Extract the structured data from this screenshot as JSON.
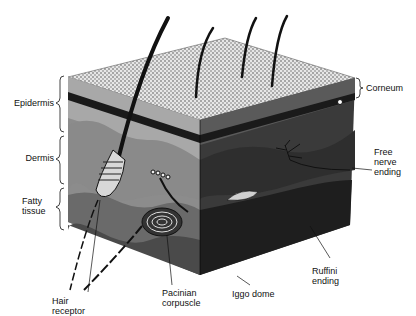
{
  "diagram": {
    "layer_labels": {
      "epidermis": "Epidermis",
      "dermis": "Dermis",
      "fatty_tissue": "Fatty\ntissue",
      "corneum": "Corneum"
    },
    "receptor_labels": {
      "free_nerve_ending": "Free\nnerve\nending",
      "ruffini_ending": "Ruffini\nending",
      "iggo_dome": "Iggo dome",
      "pacinian_corpuscle": "Pacinian\ncorpuscle",
      "hair_receptor": "Hair\nreceptor"
    },
    "colors": {
      "surface": "#cfcfcf",
      "epidermis_left": "#a8a8a8",
      "epidermis_right": "#5a5a5a",
      "dermis_left": "#8c8c8c",
      "dermis_right": "#3a3a3a",
      "fat_left": "#6a6a6a",
      "fat_right": "#1e1e1e",
      "band": "#1a1a1a",
      "ink": "#111111"
    }
  }
}
